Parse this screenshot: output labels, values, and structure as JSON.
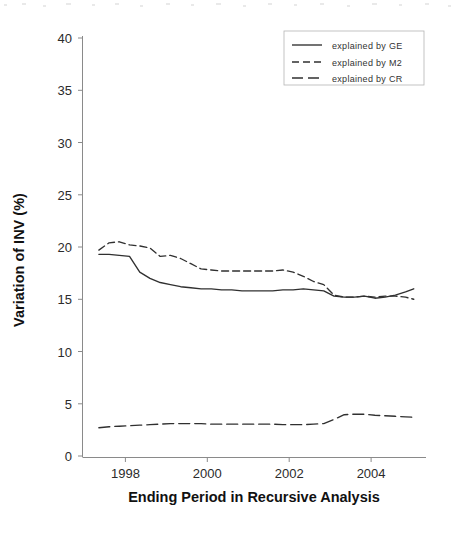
{
  "chart_data": {
    "type": "line",
    "title": "",
    "xlabel": "Ending Period in Recursive Analysis",
    "ylabel": "Variation of INV (%)",
    "xlim": [
      1997.0,
      2005.4
    ],
    "ylim": [
      0,
      40
    ],
    "grid": false,
    "legend_position": "top-right",
    "xticks": [
      1998,
      2000,
      2002,
      2004
    ],
    "xtick_labels": [
      "1998",
      "2000",
      "2002",
      "2004"
    ],
    "yticks": [
      0,
      5,
      10,
      15,
      20,
      25,
      30,
      35,
      40
    ],
    "ytick_labels": [
      "0",
      "5",
      "10",
      "15",
      "20",
      "25",
      "30",
      "35",
      "40"
    ],
    "x": [
      1997.4,
      1997.65,
      1997.9,
      1998.15,
      1998.4,
      1998.65,
      1998.9,
      1999.15,
      1999.4,
      1999.65,
      1999.9,
      2000.15,
      2000.4,
      2000.65,
      2000.9,
      2001.15,
      2001.4,
      2001.65,
      2001.9,
      2002.15,
      2002.4,
      2002.65,
      2002.9,
      2003.15,
      2003.4,
      2003.65,
      2003.9,
      2004.15,
      2004.4,
      2004.65,
      2004.9,
      2005.1
    ],
    "series": [
      {
        "name": "explained by GE",
        "style": "solid",
        "values": [
          19.3,
          19.3,
          19.2,
          19.1,
          17.6,
          17.0,
          16.6,
          16.4,
          16.2,
          16.1,
          16.0,
          16.0,
          15.9,
          15.9,
          15.8,
          15.8,
          15.8,
          15.8,
          15.9,
          15.9,
          16.0,
          15.9,
          15.8,
          15.3,
          15.2,
          15.2,
          15.3,
          15.1,
          15.2,
          15.4,
          15.7,
          16.0
        ]
      },
      {
        "name": "explained by M2",
        "style": "dashed",
        "values": [
          19.7,
          20.4,
          20.5,
          20.2,
          20.1,
          19.9,
          19.1,
          19.2,
          18.9,
          18.4,
          17.9,
          17.8,
          17.7,
          17.7,
          17.7,
          17.7,
          17.7,
          17.7,
          17.8,
          17.6,
          17.2,
          16.7,
          16.4,
          15.4,
          15.2,
          15.2,
          15.3,
          15.2,
          15.3,
          15.3,
          15.2,
          15.0
        ]
      },
      {
        "name": "explained by CR",
        "style": "long-dashed",
        "values": [
          2.7,
          2.8,
          2.85,
          2.9,
          2.95,
          3.0,
          3.05,
          3.1,
          3.1,
          3.1,
          3.1,
          3.05,
          3.05,
          3.05,
          3.05,
          3.05,
          3.05,
          3.05,
          3.0,
          3.0,
          3.0,
          3.05,
          3.1,
          3.5,
          3.95,
          4.0,
          4.0,
          3.9,
          3.85,
          3.8,
          3.75,
          3.7
        ]
      }
    ]
  },
  "legend": {
    "entries": [
      {
        "label": "explained by GE",
        "style": "solid"
      },
      {
        "label": "explained by M2",
        "style": "dashed"
      },
      {
        "label": "explained by CR",
        "style": "long-dashed"
      }
    ]
  }
}
